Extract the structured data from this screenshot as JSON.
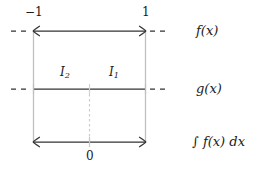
{
  "figure": {
    "type": "math-interval-diagram",
    "background": "#ffffff",
    "ink_color": "#262626",
    "faint_color": "#c8c8c8",
    "axis_tick_labels": {
      "left_endpoint": "−1",
      "right_endpoint": "1",
      "center": "0"
    },
    "rows": [
      {
        "id": "row-fx",
        "label": "f(x)",
        "label_base": "f",
        "label_arg": "(x)",
        "y": 31,
        "segment": {
          "x1": 33,
          "x2": 146
        },
        "endpoint_style": "arrow",
        "dashes_left": {
          "x1": 11,
          "x2": 29
        },
        "dashes_right": {
          "x1": 150,
          "x2": 168
        }
      },
      {
        "id": "row-gx",
        "label": "g(x)",
        "label_base": "g",
        "label_arg": "(x)",
        "y": 89,
        "segment": {
          "x1": 33,
          "x2": 146
        },
        "endpoint_style": "tick-faint",
        "dashes_left": {
          "x1": 11,
          "x2": 29
        },
        "dashes_right": {
          "x1": 150,
          "x2": 168
        }
      },
      {
        "id": "row-integral",
        "label": "∫ f(x) dx",
        "label_base": "∫ f",
        "label_arg": "(x)",
        "label_tail": "dx",
        "y": 142,
        "segment": {
          "x1": 33,
          "x2": 146
        },
        "endpoint_style": "arrow",
        "dashes_left": null,
        "dashes_right": null
      }
    ],
    "interval_labels": [
      {
        "id": "I2",
        "text": "I",
        "subscript": "2",
        "x": 63,
        "y": 72
      },
      {
        "id": "I1",
        "text": "I",
        "subscript": "1",
        "x": 112,
        "y": 72
      }
    ],
    "verticals": [
      {
        "id": "left-rail",
        "x": 33,
        "y1": 31,
        "y2": 142,
        "style": "solid-faint"
      },
      {
        "id": "right-rail",
        "x": 146,
        "y1": 31,
        "y2": 142,
        "style": "solid-faint"
      },
      {
        "id": "center-rail",
        "x": 89,
        "y1": 89,
        "y2": 142,
        "style": "dashed-faint"
      }
    ],
    "label_column_x": 196
  }
}
